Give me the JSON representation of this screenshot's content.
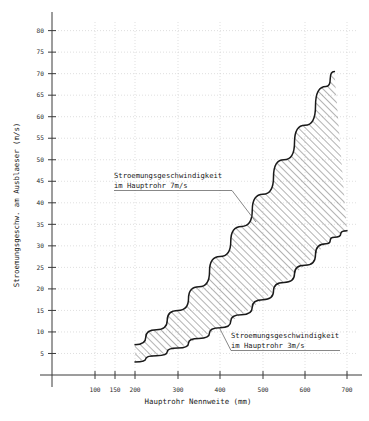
{
  "chart_data": {
    "type": "area",
    "title": "",
    "xlabel": "Hauptrohr Nennweite  (mm)",
    "ylabel": "Stroemungsgeschw. am Ausblaeser  (m/s)",
    "xtick_labels": [
      "100",
      "150",
      "200",
      "300",
      "400",
      "500",
      "600",
      "700"
    ],
    "xtick_values": [
      100,
      150,
      200,
      300,
      400,
      500,
      600,
      700
    ],
    "ytick_labels": [
      "5",
      "10",
      "15",
      "20",
      "25",
      "30",
      "35",
      "40",
      "45",
      "50",
      "55",
      "60",
      "65",
      "70",
      "75",
      "80"
    ],
    "ytick_values": [
      5,
      10,
      15,
      20,
      25,
      30,
      35,
      40,
      45,
      50,
      55,
      60,
      65,
      70,
      75,
      80
    ],
    "ylim": [
      0,
      82
    ],
    "grid": true,
    "legend": "none",
    "x": [
      200,
      250,
      300,
      350,
      400,
      450,
      500,
      550,
      600,
      650,
      670
    ],
    "series": [
      {
        "name": "Stroemungsgeschwindigkeit im Hauptrohr 7m/s",
        "values": [
          7.0,
          10.5,
          15.0,
          20.5,
          27.5,
          34.5,
          42.0,
          50.0,
          58.0,
          67.0,
          70.5
        ]
      },
      {
        "name": "Stroemungsgeschwindigkeit im Hauptrohr 3m/s",
        "values": [
          3.0,
          4.5,
          6.3,
          8.5,
          11.0,
          14.0,
          17.5,
          21.5,
          25.5,
          30.5,
          32.0
        ]
      }
    ],
    "lower_series_x_end": 700,
    "lower_series_y_end": 33.5,
    "annotations": [
      {
        "id": "upper",
        "line1": "Stroemungsgeschwindigkeit",
        "line2": "im Hauptrohr 7m/s"
      },
      {
        "id": "lower",
        "line1": "Stroemungsgeschwindigkeit",
        "line2": "im Hauptrohr 3m/s"
      }
    ]
  },
  "colors": {
    "axis": "#3a3a3a",
    "grid": "#c9c9c9",
    "curve": "#1a1a1a",
    "hatch": "#555555",
    "background": "#ffffff"
  }
}
